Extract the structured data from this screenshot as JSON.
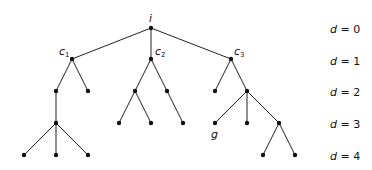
{
  "diagram": {
    "type": "tree",
    "root_label": "i",
    "goal_label": "g",
    "nodes": [
      {
        "id": "i",
        "x": 151,
        "y": 28,
        "label": "i"
      },
      {
        "id": "c1",
        "x": 72,
        "y": 59,
        "label": "c",
        "sub": "1"
      },
      {
        "id": "c2",
        "x": 151,
        "y": 59,
        "label": "c",
        "sub": "2"
      },
      {
        "id": "c3",
        "x": 231,
        "y": 59,
        "label": "c",
        "sub": "3"
      },
      {
        "id": "a1",
        "x": 56,
        "y": 91
      },
      {
        "id": "a2",
        "x": 88,
        "y": 91
      },
      {
        "id": "a3",
        "x": 56,
        "y": 123
      },
      {
        "id": "a4",
        "x": 24,
        "y": 155
      },
      {
        "id": "a5",
        "x": 56,
        "y": 155
      },
      {
        "id": "a6",
        "x": 88,
        "y": 155
      },
      {
        "id": "b1",
        "x": 135,
        "y": 91
      },
      {
        "id": "b2",
        "x": 167,
        "y": 91
      },
      {
        "id": "b3",
        "x": 119,
        "y": 123
      },
      {
        "id": "b4",
        "x": 151,
        "y": 123
      },
      {
        "id": "b5",
        "x": 183,
        "y": 123
      },
      {
        "id": "e1",
        "x": 215,
        "y": 91
      },
      {
        "id": "e2",
        "x": 247,
        "y": 91
      },
      {
        "id": "g",
        "x": 215,
        "y": 123,
        "label": "g"
      },
      {
        "id": "e3",
        "x": 247,
        "y": 123
      },
      {
        "id": "e4",
        "x": 279,
        "y": 123
      },
      {
        "id": "e5",
        "x": 263,
        "y": 155
      },
      {
        "id": "e6",
        "x": 295,
        "y": 155
      }
    ],
    "edges": [
      [
        "i",
        "c1"
      ],
      [
        "i",
        "c2"
      ],
      [
        "i",
        "c3"
      ],
      [
        "c1",
        "a1"
      ],
      [
        "c1",
        "a2"
      ],
      [
        "a1",
        "a3"
      ],
      [
        "a3",
        "a4"
      ],
      [
        "a3",
        "a5"
      ],
      [
        "a3",
        "a6"
      ],
      [
        "c2",
        "b1"
      ],
      [
        "c2",
        "b2"
      ],
      [
        "b1",
        "b3"
      ],
      [
        "b1",
        "b4"
      ],
      [
        "b2",
        "b5"
      ],
      [
        "c3",
        "e1"
      ],
      [
        "c3",
        "e2"
      ],
      [
        "e2",
        "g"
      ],
      [
        "e2",
        "e3"
      ],
      [
        "e2",
        "e4"
      ],
      [
        "e4",
        "e5"
      ],
      [
        "e4",
        "e6"
      ]
    ],
    "depth_labels": [
      {
        "var": "d",
        "text": " = 0",
        "y": 33
      },
      {
        "var": "d",
        "text": " = 1",
        "y": 65
      },
      {
        "var": "d",
        "text": " = 2",
        "y": 96
      },
      {
        "var": "d",
        "text": " = 3",
        "y": 128
      },
      {
        "var": "d",
        "text": " = 4",
        "y": 160
      }
    ],
    "colors": {
      "line": "#222222",
      "node": "#111111",
      "background": "#ffffff"
    }
  }
}
